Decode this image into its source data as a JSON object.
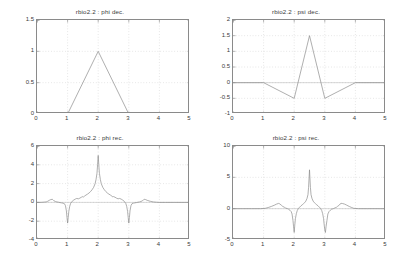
{
  "figure": {
    "background_color": "#ffffff",
    "axis_color": "#8a8a8a",
    "curve_color": "#8c8c8c",
    "grid_color": "#c8c8c8",
    "text_color": "#3a3a3a",
    "wavelet_name": "rbio2.2"
  },
  "chart_data": [
    {
      "type": "line",
      "panel": "top-left",
      "title": "rbio2.2 : phi dec.",
      "xlabel": "",
      "ylabel": "",
      "xlim": [
        0,
        5
      ],
      "ylim": [
        0,
        1.5
      ],
      "xticks": [
        0,
        1,
        2,
        3,
        4,
        5
      ],
      "xticklabels": [
        "0",
        "1",
        "2",
        "3",
        "4",
        "5"
      ],
      "yticks": [
        0,
        0.5,
        1,
        1.5
      ],
      "yticklabels": [
        "0",
        "0.5",
        "1",
        "1.5"
      ],
      "grid": true,
      "legend": null,
      "series": [
        {
          "name": "phi dec.",
          "x": [
            0,
            1,
            2,
            3,
            5
          ],
          "y": [
            0,
            0,
            1,
            0,
            0
          ]
        }
      ]
    },
    {
      "type": "line",
      "panel": "top-right",
      "title": "rbio2.2 : psi dec.",
      "xlabel": "",
      "ylabel": "",
      "xlim": [
        0,
        5
      ],
      "ylim": [
        -1,
        2
      ],
      "xticks": [
        0,
        1,
        2,
        3,
        4,
        5
      ],
      "xticklabels": [
        "0",
        "1",
        "2",
        "3",
        "4",
        "5"
      ],
      "yticks": [
        -1,
        -0.5,
        0,
        0.5,
        1,
        1.5,
        2
      ],
      "yticklabels": [
        "-1",
        "-0.5",
        "0",
        "0.5",
        "1",
        "1.5",
        "2"
      ],
      "grid": true,
      "legend": null,
      "series": [
        {
          "name": "psi dec.",
          "x": [
            0,
            1,
            2,
            2.5,
            3,
            4,
            5
          ],
          "y": [
            0,
            0,
            -0.5,
            1.5,
            -0.5,
            0,
            0
          ]
        }
      ]
    },
    {
      "type": "line",
      "panel": "bottom-left",
      "title": "rbio2.2 : phi rec.",
      "xlabel": "",
      "ylabel": "",
      "xlim": [
        0,
        5
      ],
      "ylim": [
        -4,
        6
      ],
      "xticks": [
        0,
        1,
        2,
        3,
        4,
        5
      ],
      "xticklabels": [
        "0",
        "1",
        "2",
        "3",
        "4",
        "5"
      ],
      "yticks": [
        -4,
        -2,
        0,
        2,
        4,
        6
      ],
      "yticklabels": [
        "-4",
        "-2",
        "0",
        "2",
        "4",
        "6"
      ],
      "grid": true,
      "legend": null,
      "series": [
        {
          "name": "phi rec.",
          "description": "Fractal reconstruction scaling function: flat near zero outside [0.4,3.6], central spike to 5.0 at x=2, negative spikes to -2.2 at x=1 and x=3",
          "x": [
            0.0,
            0.1,
            0.2,
            0.3,
            0.35,
            0.4,
            0.45,
            0.5,
            0.52,
            0.55,
            0.6,
            0.65,
            0.7,
            0.75,
            0.8,
            0.85,
            0.9,
            0.93,
            0.96,
            0.98,
            1.0,
            1.02,
            1.04,
            1.07,
            1.1,
            1.15,
            1.2,
            1.25,
            1.3,
            1.35,
            1.4,
            1.45,
            1.5,
            1.52,
            1.55,
            1.6,
            1.65,
            1.7,
            1.75,
            1.8,
            1.85,
            1.9,
            1.93,
            1.96,
            1.98,
            2.0,
            2.02,
            2.04,
            2.07,
            2.1,
            2.15,
            2.2,
            2.25,
            2.3,
            2.35,
            2.4,
            2.45,
            2.48,
            2.5,
            2.55,
            2.6,
            2.65,
            2.7,
            2.75,
            2.8,
            2.85,
            2.9,
            2.93,
            2.96,
            2.98,
            3.0,
            3.02,
            3.04,
            3.07,
            3.1,
            3.15,
            3.2,
            3.25,
            3.3,
            3.35,
            3.4,
            3.45,
            3.48,
            3.5,
            3.55,
            3.6,
            3.7,
            3.8,
            3.9,
            4.0,
            4.2,
            4.5,
            5.0
          ],
          "y": [
            0.0,
            0.0,
            0.02,
            0.05,
            0.12,
            0.22,
            0.3,
            0.33,
            0.28,
            0.18,
            0.1,
            0.05,
            0.02,
            -0.02,
            -0.05,
            -0.08,
            -0.15,
            -0.35,
            -0.9,
            -1.6,
            -2.2,
            -1.6,
            -0.95,
            -0.4,
            -0.1,
            0.12,
            0.25,
            0.35,
            0.42,
            0.38,
            0.45,
            0.55,
            0.62,
            0.58,
            0.66,
            0.78,
            0.88,
            1.0,
            1.15,
            1.35,
            1.6,
            2.0,
            2.45,
            3.1,
            4.0,
            5.0,
            4.0,
            3.1,
            2.45,
            2.0,
            1.6,
            1.35,
            1.15,
            1.0,
            0.88,
            0.78,
            0.66,
            0.58,
            0.62,
            0.55,
            0.45,
            0.38,
            0.42,
            0.35,
            0.25,
            0.12,
            -0.1,
            -0.4,
            -0.95,
            -1.6,
            -2.2,
            -1.6,
            -0.9,
            -0.35,
            -0.15,
            -0.08,
            -0.05,
            -0.02,
            0.02,
            0.05,
            0.1,
            0.18,
            0.28,
            0.33,
            0.3,
            0.22,
            0.12,
            0.05,
            0.02,
            0.0,
            0.0,
            0.0,
            0.0,
            0.0
          ]
        }
      ]
    },
    {
      "type": "line",
      "panel": "bottom-right",
      "title": "rbio2.2 : psi rec.",
      "xlabel": "",
      "ylabel": "",
      "xlim": [
        0,
        5
      ],
      "ylim": [
        -5,
        10
      ],
      "xticks": [
        0,
        1,
        2,
        3,
        4,
        5
      ],
      "xticklabels": [
        "0",
        "1",
        "2",
        "3",
        "4",
        "5"
      ],
      "yticks": [
        -5,
        0,
        5,
        10
      ],
      "yticklabels": [
        "-5",
        "0",
        "5",
        "10"
      ],
      "grid": true,
      "legend": null,
      "series": [
        {
          "name": "psi rec.",
          "description": "Fractal reconstruction wavelet function: flat near zero outside [1.1,3.9], central spike to 6.2 at x=2.5, negative spikes to -3.8 at x=2 and x=3",
          "x": [
            0.0,
            0.3,
            0.6,
            0.9,
            1.05,
            1.15,
            1.25,
            1.35,
            1.42,
            1.48,
            1.5,
            1.53,
            1.58,
            1.62,
            1.68,
            1.72,
            1.78,
            1.82,
            1.86,
            1.9,
            1.93,
            1.96,
            1.98,
            2.0,
            2.02,
            2.04,
            2.07,
            2.1,
            2.14,
            2.18,
            2.22,
            2.26,
            2.3,
            2.34,
            2.38,
            2.42,
            2.45,
            2.47,
            2.5,
            2.53,
            2.55,
            2.58,
            2.62,
            2.66,
            2.7,
            2.74,
            2.78,
            2.82,
            2.86,
            2.9,
            2.93,
            2.96,
            2.98,
            3.0,
            3.02,
            3.04,
            3.07,
            3.1,
            3.14,
            3.18,
            3.22,
            3.28,
            3.32,
            3.38,
            3.42,
            3.47,
            3.5,
            3.53,
            3.58,
            3.65,
            3.72,
            3.8,
            3.88,
            3.95,
            4.1,
            4.4,
            4.8,
            5.0
          ],
          "y": [
            0.0,
            0.0,
            0.0,
            0.0,
            0.05,
            0.18,
            0.35,
            0.55,
            0.72,
            0.82,
            0.85,
            0.75,
            0.55,
            0.38,
            0.22,
            0.1,
            0.0,
            -0.1,
            -0.25,
            -0.45,
            -0.85,
            -1.9,
            -2.9,
            -3.8,
            -2.6,
            -1.6,
            -0.8,
            -0.3,
            0.05,
            0.25,
            0.45,
            0.6,
            0.78,
            0.95,
            1.2,
            1.65,
            2.25,
            3.4,
            6.2,
            3.4,
            2.25,
            1.65,
            1.2,
            0.95,
            0.78,
            0.6,
            0.45,
            0.25,
            0.05,
            -0.3,
            -0.8,
            -1.6,
            -2.6,
            -3.4,
            -3.8,
            -2.9,
            -1.9,
            -0.85,
            -0.45,
            -0.25,
            -0.1,
            0.0,
            0.1,
            0.22,
            0.38,
            0.55,
            0.75,
            0.85,
            0.82,
            0.72,
            0.55,
            0.35,
            0.18,
            0.05,
            0.0,
            0.0,
            0.0,
            0.0,
            0.0
          ]
        }
      ]
    }
  ]
}
